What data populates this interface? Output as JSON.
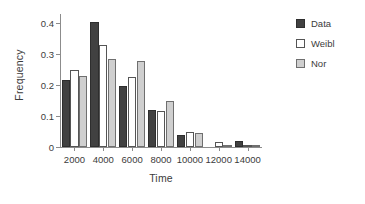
{
  "chart_data": {
    "type": "bar",
    "title": "",
    "xlabel": "Time",
    "ylabel": "Frequency",
    "categories": [
      "2000",
      "4000",
      "6000",
      "8000",
      "10000",
      "12000",
      "14000"
    ],
    "series": [
      {
        "name": "Data",
        "color": "#414141",
        "values": [
          0.216,
          0.403,
          0.198,
          0.12,
          0.039,
          0.0,
          0.021
        ]
      },
      {
        "name": "Weibl",
        "color": "#ffffff",
        "values": [
          0.248,
          0.331,
          0.227,
          0.116,
          0.048,
          0.015,
          0.004
        ]
      },
      {
        "name": "Nor",
        "color": "#cfcfcf",
        "values": [
          0.228,
          0.285,
          0.279,
          0.15,
          0.044,
          0.007,
          0.003
        ]
      }
    ],
    "yticks": [
      "0",
      "0.1",
      "0.2",
      "0.3",
      "0.4"
    ],
    "ytick_values": [
      0,
      0.1,
      0.2,
      0.3,
      0.4
    ],
    "ylim": [
      0,
      0.43
    ],
    "xtick_labels": [
      "2000",
      "4000",
      "6000",
      "8000",
      "10000",
      "12000",
      "14000"
    ],
    "grid": false,
    "legend_position": "right-outside"
  },
  "legend": {
    "items": [
      {
        "label": "Data"
      },
      {
        "label": "Weibl"
      },
      {
        "label": "Nor"
      }
    ]
  },
  "axes": {
    "y_title": "Frequency",
    "x_title": "Time"
  }
}
